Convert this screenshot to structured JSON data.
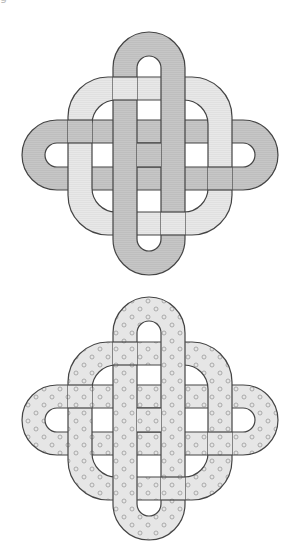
{
  "page": {
    "caption_fragment": "g"
  },
  "knots": [
    {
      "id": "knot-shaded",
      "style": "shaded",
      "band_dark": "#c6c6c6",
      "band_light": "#e8e8e8",
      "stroke": "#444444"
    },
    {
      "id": "knot-dotted",
      "style": "dotted",
      "band_fill": "#e6e6e6",
      "dot_stroke": "#9a9a9a",
      "stroke": "#444444"
    }
  ]
}
